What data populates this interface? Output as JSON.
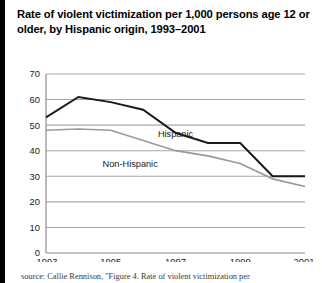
{
  "figure": {
    "title": "Rate of violent victimization per 1,000 persons age 12 or older, by Hispanic origin, 1993–2001",
    "source_note": "source: Callie Rennison, \"Figure 4. Rate of violent victimization per"
  },
  "chart_data": {
    "type": "line",
    "title": "Rate of violent victimization per 1,000 persons age 12 or older, by Hispanic origin, 1993–2001",
    "xlabel": "",
    "ylabel": "",
    "x": [
      1993,
      1994,
      1995,
      1996,
      1997,
      1998,
      1999,
      2000,
      2001
    ],
    "xtick_labels": [
      "1993",
      "1995",
      "1997",
      "1999",
      "2001"
    ],
    "xtick_values": [
      1993,
      1995,
      1997,
      1999,
      2001
    ],
    "ytick_labels": [
      "0",
      "10",
      "20",
      "30",
      "40",
      "50",
      "60",
      "70"
    ],
    "ytick_values": [
      0,
      10,
      20,
      30,
      40,
      50,
      60,
      70
    ],
    "xlim": [
      1993,
      2001
    ],
    "ylim": [
      0,
      70
    ],
    "grid": true,
    "legend_position": "inline-labels",
    "series": [
      {
        "name": "Hispanic",
        "color": "#1a1a1a",
        "values": [
          53,
          61,
          59,
          56,
          47,
          43,
          43,
          30,
          30
        ]
      },
      {
        "name": "Non-Hispanic",
        "color": "#9a9a9a",
        "values": [
          48,
          48.5,
          48,
          44,
          40,
          38,
          35,
          29,
          26
        ]
      }
    ],
    "annotations": [
      {
        "text": "Hispanic",
        "x": 1997.0,
        "y": 45.5
      },
      {
        "text": "Non-Hispanic",
        "x": 1995.6,
        "y": 33.5
      }
    ]
  }
}
